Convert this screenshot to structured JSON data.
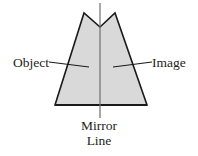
{
  "figure": {
    "background_color": "#ffffff"
  },
  "shape": {
    "name": "reflected-polygon",
    "fill_color": "#d9d9d9",
    "stroke_color": "#1a1a1a",
    "stroke_width": 1.6,
    "description": "Symmetric notched pentagon-like outline with two peaks, straddling the vertical mirror line",
    "points": "55,105 84,13 100,27 115,13 147,105"
  },
  "mirror_line": {
    "name": "mirror-line",
    "color": "#6e6e6e",
    "stroke_width": 1.2,
    "x": 100,
    "y_top": 3,
    "y_bottom": 118
  },
  "leaders": {
    "object": {
      "x1": 49,
      "y1": 62,
      "x2": 89,
      "y2": 67,
      "color": "#1a1a1a"
    },
    "image": {
      "x1": 113,
      "y1": 67,
      "x2": 152,
      "y2": 62,
      "color": "#1a1a1a"
    }
  },
  "labels": {
    "object": "Object",
    "image": "Image",
    "mirror": "Mirror",
    "line": "Line"
  }
}
